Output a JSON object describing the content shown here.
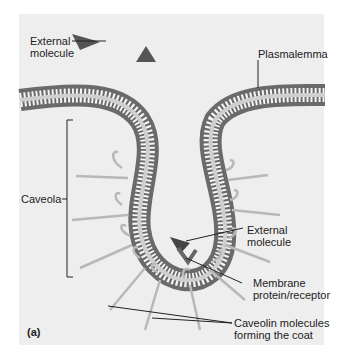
{
  "figure": {
    "panel_label": "(a)",
    "labels": {
      "external_molecule_top": [
        "External",
        "molecule"
      ],
      "plasmalemma": "Plasmalemma",
      "caveola": "Caveola",
      "external_molecule_inner": [
        "External",
        "molecule"
      ],
      "membrane_protein": [
        "Membrane",
        "protein/receptor"
      ],
      "caveolin": [
        "Caveolin molecules",
        "forming the coat"
      ]
    },
    "colors": {
      "background": "#eeeeee",
      "head": "#7a7a7a",
      "tail": "#ffffff",
      "molecule": "#555555",
      "caveolin": "#b8b8b8",
      "leader": "#222222"
    }
  }
}
